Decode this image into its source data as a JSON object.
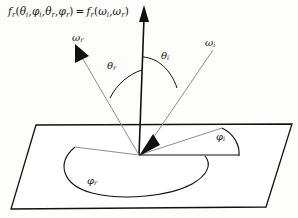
{
  "figure": {
    "kind": "brdf-geometry-diagram",
    "formula": {
      "lhs_function": "f",
      "lhs_function_sub": "r",
      "lhs_args": [
        "θ",
        "φ",
        "θ",
        "φ"
      ],
      "lhs_arg_subs": [
        "i",
        "i",
        "r",
        "r"
      ],
      "equals": "=",
      "rhs_function": "f",
      "rhs_function_sub": "r",
      "rhs_args": [
        "ω",
        "ω"
      ],
      "rhs_arg_subs": [
        "i",
        "r"
      ],
      "plain_text": "f_r(θ_i, φ_i, θ_r, φ_r) = f_r(ω_i, ω_r)"
    },
    "labels": {
      "omega_r": {
        "symbol": "ω",
        "sub": "r",
        "text": "ωr"
      },
      "omega_i": {
        "symbol": "ω",
        "sub": "i",
        "text": "ωi"
      },
      "theta_r": {
        "symbol": "θ",
        "sub": "r",
        "text": "θr"
      },
      "theta_i": {
        "symbol": "θ",
        "sub": "i",
        "text": "θi"
      },
      "phi_i": {
        "symbol": "φ",
        "sub": "i",
        "text": "φi"
      },
      "phi_r": {
        "symbol": "φ",
        "sub": "r",
        "text": "φr"
      }
    },
    "colors": {
      "background": "#fdfdfb",
      "ink": "#111111",
      "ray_gray": "#8d8d8d",
      "plane_outline": "#111111"
    },
    "geometry": {
      "origin": [
        139,
        155
      ],
      "normal_tip": [
        148,
        6
      ],
      "plane_corners": [
        [
          36,
          125
        ],
        [
          292,
          124
        ],
        [
          266,
          207
        ],
        [
          11,
          209
        ]
      ],
      "omega_r_tip": [
        74,
        48
      ],
      "omega_i_tail": [
        215,
        47
      ],
      "azimuth_i_tip": [
        222,
        128
      ],
      "azimuth_r_tip": [
        75,
        147
      ],
      "horizontal_ref_end": [
        238,
        155
      ]
    }
  }
}
